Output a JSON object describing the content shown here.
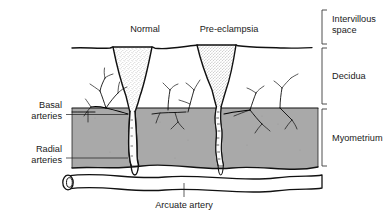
{
  "figure": {
    "background_color": "#ffffff",
    "ink_color": "#111111",
    "myometrium_fill": "#a9a9a9",
    "lumen_fill": "#ffffff",
    "stipple_color": "#8c8c8c"
  },
  "top_labels": [
    {
      "id": "normal",
      "text": "Normal"
    },
    {
      "id": "pre-eclampsia",
      "text": "Pre-eclampsia"
    }
  ],
  "left_labels": [
    {
      "id": "basal-arteries",
      "line1": "Basal",
      "line2": "arteries"
    },
    {
      "id": "radial-arteries",
      "line1": "Radial",
      "line2": "arteries"
    }
  ],
  "bottom_labels": [
    {
      "id": "arcuate-artery",
      "text": "Arcuate artery"
    }
  ],
  "layer_brackets": [
    {
      "id": "intervillous-space",
      "line1": "Intervillous",
      "line2": "space"
    },
    {
      "id": "decidua",
      "line1": "Decidua",
      "line2": ""
    },
    {
      "id": "myometrium",
      "line1": "Myometrium",
      "line2": ""
    }
  ]
}
